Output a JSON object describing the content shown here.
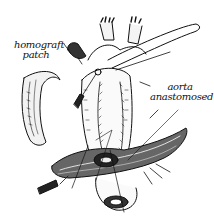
{
  "figure": {
    "type": "surgical line illustration",
    "labels": [
      {
        "id": "homograft",
        "line1": "homograft",
        "line2": "patch"
      },
      {
        "id": "aorta",
        "line1": "aorta",
        "line2": "anastomosed"
      }
    ],
    "colors": {
      "ink": "#111111",
      "background": "#ffffff"
    }
  }
}
